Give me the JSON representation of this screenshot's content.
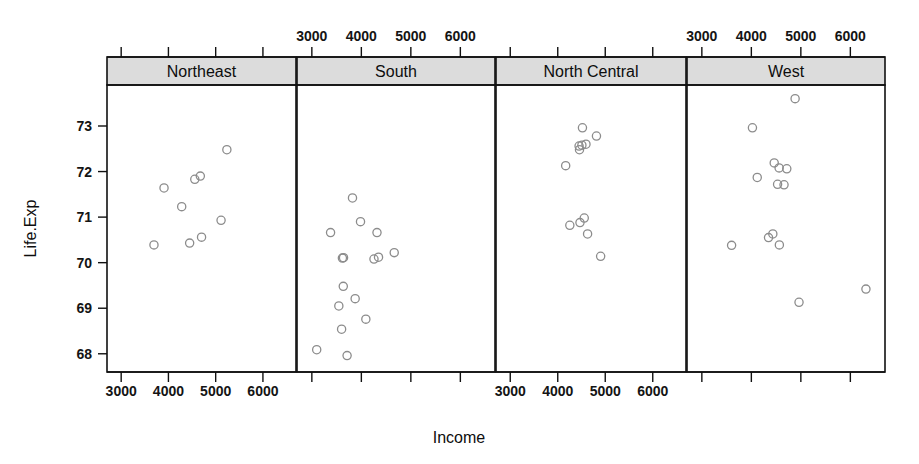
{
  "chart_data": {
    "type": "scatter",
    "title": "",
    "xlabel": "Income",
    "ylabel": "Life.Exp",
    "xlim": [
      2700,
      6700
    ],
    "ylim": [
      67.6,
      73.9
    ],
    "grid": false,
    "legend": "none",
    "conditioned_by": "Region",
    "x_ticks": [
      3000,
      4000,
      5000,
      6000
    ],
    "y_ticks": [
      68,
      69,
      70,
      71,
      72,
      73
    ],
    "x_tick_labels": [
      "3000",
      "4000",
      "5000",
      "6000"
    ],
    "y_tick_labels": [
      "68",
      "69",
      "70",
      "71",
      "72",
      "73"
    ],
    "point_marker": "open-circle",
    "point_color": "#8c8c8c",
    "strip_background": "#dcdcdc",
    "panels": [
      {
        "label": "Northeast",
        "strip_index": 0,
        "x_axis_labels_shown": true,
        "x_axis_labels_position": "bottom",
        "n_points": 9,
        "points": [
          {
            "income": 3694,
            "life_exp": 70.39
          },
          {
            "income": 3907,
            "life_exp": 71.64
          },
          {
            "income": 4281,
            "life_exp": 71.23
          },
          {
            "income": 4449,
            "life_exp": 70.43
          },
          {
            "income": 4558,
            "life_exp": 71.83
          },
          {
            "income": 4675,
            "life_exp": 71.9
          },
          {
            "income": 4701,
            "life_exp": 70.56
          },
          {
            "income": 5114,
            "life_exp": 70.93
          },
          {
            "income": 5237,
            "life_exp": 72.48
          }
        ]
      },
      {
        "label": "South",
        "strip_index": 1,
        "x_axis_labels_shown": true,
        "x_axis_labels_position": "top",
        "n_points": 16,
        "points": [
          {
            "income": 3098,
            "life_exp": 68.09
          },
          {
            "income": 3378,
            "life_exp": 70.66
          },
          {
            "income": 3545,
            "life_exp": 69.05
          },
          {
            "income": 3601,
            "life_exp": 68.54
          },
          {
            "income": 3617,
            "life_exp": 70.1
          },
          {
            "income": 3635,
            "life_exp": 69.48
          },
          {
            "income": 3640,
            "life_exp": 70.11
          },
          {
            "income": 3712,
            "life_exp": 67.96
          },
          {
            "income": 3821,
            "life_exp": 71.42
          },
          {
            "income": 3875,
            "life_exp": 69.21
          },
          {
            "income": 3983,
            "life_exp": 70.9
          },
          {
            "income": 4091,
            "life_exp": 68.76
          },
          {
            "income": 4255,
            "life_exp": 70.08
          },
          {
            "income": 4316,
            "life_exp": 70.66
          },
          {
            "income": 4347,
            "life_exp": 70.12
          },
          {
            "income": 4664,
            "life_exp": 70.22
          }
        ]
      },
      {
        "label": "North Central",
        "strip_index": 2,
        "x_axis_labels_shown": true,
        "x_axis_labels_position": "bottom",
        "n_points": 12,
        "points": [
          {
            "income": 4167,
            "life_exp": 72.13
          },
          {
            "income": 4254,
            "life_exp": 70.82
          },
          {
            "income": 4449,
            "life_exp": 72.56
          },
          {
            "income": 4458,
            "life_exp": 72.48
          },
          {
            "income": 4468,
            "life_exp": 70.88
          },
          {
            "income": 4508,
            "life_exp": 72.58
          },
          {
            "income": 4520,
            "life_exp": 72.96
          },
          {
            "income": 4558,
            "life_exp": 70.98
          },
          {
            "income": 4594,
            "life_exp": 72.6
          },
          {
            "income": 4628,
            "life_exp": 70.63
          },
          {
            "income": 4815,
            "life_exp": 72.78
          },
          {
            "income": 4903,
            "life_exp": 70.14
          }
        ]
      },
      {
        "label": "West",
        "strip_index": 3,
        "x_axis_labels_shown": true,
        "x_axis_labels_position": "top",
        "n_points": 13,
        "points": [
          {
            "income": 3601,
            "life_exp": 70.38
          },
          {
            "income": 4022,
            "life_exp": 72.96
          },
          {
            "income": 4119,
            "life_exp": 71.87
          },
          {
            "income": 4347,
            "life_exp": 70.55
          },
          {
            "income": 4434,
            "life_exp": 70.63
          },
          {
            "income": 4462,
            "life_exp": 72.19
          },
          {
            "income": 4530,
            "life_exp": 71.72
          },
          {
            "income": 4561,
            "life_exp": 72.08
          },
          {
            "income": 4566,
            "life_exp": 70.39
          },
          {
            "income": 4660,
            "life_exp": 71.71
          },
          {
            "income": 4716,
            "life_exp": 72.06
          },
          {
            "income": 4884,
            "life_exp": 73.6
          },
          {
            "income": 4963,
            "life_exp": 69.13
          },
          {
            "income": 6315,
            "life_exp": 69.42
          }
        ]
      }
    ]
  }
}
